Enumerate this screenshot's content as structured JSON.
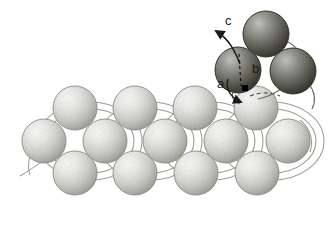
{
  "figure": {
    "background_color": "#ffffff",
    "width": 333,
    "height": 226
  },
  "colors": {
    "sphere_light_highlight": "#f2f2f0",
    "sphere_light_mid": "#cfcfca",
    "sphere_light_shadow": "#a9a9a3",
    "sphere_light_outline": "#8a8a84",
    "sphere_dark_highlight": "#b8b8b2",
    "sphere_dark_mid": "#77776f",
    "sphere_dark_shadow": "#3a3a35",
    "sphere_dark_outline": "#2b2b27",
    "bond_line": "#9b9b95",
    "annotation": "#1a1a1a",
    "marker_square": "#000000"
  },
  "labels": [
    {
      "id": "c",
      "text": "c",
      "x": 226,
      "y": 20,
      "font_size": 13
    },
    {
      "id": "b",
      "text": "b",
      "x": 254,
      "y": 68,
      "font_size": 13
    },
    {
      "id": "a",
      "text": "a",
      "x": 219,
      "y": 83,
      "font_size": 13
    }
  ],
  "annotations": {
    "arrow_c": {
      "name": "vector-arrow-c",
      "description": "curved arrow from adatom pointing up-left, labelled c",
      "path": "M 238,64 C 233,52 228,40 215,31",
      "arrow_tip": [
        207,
        29
      ]
    },
    "arrow_a": {
      "name": "vector-arrow-a",
      "description": "curved arrow from label a sweeping down-right to hollow site",
      "path": "M 228,78 C 226,88 230,97 240,101",
      "arrow_tip": [
        243,
        102
      ]
    },
    "dashed_vector_b": {
      "name": "vector-dashed-b",
      "description": "vertical dashed line through left dark sphere down to black square marker",
      "path": "M 239,56 L 241,88",
      "dash": "3 3"
    },
    "marker": {
      "name": "site-marker-square",
      "x": 245,
      "y": 88,
      "size": 5,
      "color": "#000000"
    },
    "dashed_site_arc": {
      "name": "hollow-site-dashed-arc",
      "description": "short dashed arc indicating the surface hollow site",
      "path": "M 256,97 C 264,94 274,94 282,97",
      "dash": "4 3"
    }
  },
  "lattice": {
    "name": "substrate-hexagonal-lattice",
    "sphere_radius": 22,
    "rows": [
      {
        "name": "substrate-row-top",
        "y": 108,
        "spheres": [
          {
            "id": "t1",
            "cx": 75,
            "cy": 108
          },
          {
            "id": "t2",
            "cx": 135,
            "cy": 108
          },
          {
            "id": "t3",
            "cx": 195,
            "cy": 108
          },
          {
            "id": "t4",
            "cx": 256,
            "cy": 108
          }
        ]
      },
      {
        "name": "substrate-row-middle",
        "y": 140,
        "spheres": [
          {
            "id": "m1",
            "cx": 44,
            "cy": 141
          },
          {
            "id": "m2",
            "cx": 105,
            "cy": 141
          },
          {
            "id": "m3",
            "cx": 165,
            "cy": 141
          },
          {
            "id": "m4",
            "cx": 226,
            "cy": 141
          },
          {
            "id": "m5",
            "cx": 288,
            "cy": 141
          }
        ]
      },
      {
        "name": "substrate-row-bottom",
        "y": 172,
        "spheres": [
          {
            "id": "b1",
            "cx": 75,
            "cy": 173
          },
          {
            "id": "b2",
            "cx": 135,
            "cy": 173
          },
          {
            "id": "b3",
            "cx": 196,
            "cy": 173
          },
          {
            "id": "b4",
            "cx": 257,
            "cy": 173
          }
        ]
      }
    ],
    "bond_rings": [
      {
        "cx": 90,
        "cy": 141,
        "rx": 50,
        "ry": 38
      },
      {
        "cx": 150,
        "cy": 141,
        "rx": 50,
        "ry": 38
      },
      {
        "cx": 211,
        "cy": 141,
        "rx": 50,
        "ry": 38
      },
      {
        "cx": 272,
        "cy": 141,
        "rx": 50,
        "ry": 38
      }
    ]
  },
  "adcluster": {
    "name": "adatom-trimer-cluster",
    "sphere_radius": 23,
    "spheres": [
      {
        "id": "d1",
        "cx": 266,
        "cy": 34,
        "label": "adatom-top"
      },
      {
        "id": "d2",
        "cx": 238,
        "cy": 70,
        "label": "adatom-left"
      },
      {
        "id": "d3",
        "cx": 293,
        "cy": 71,
        "label": "adatom-right"
      }
    ],
    "bonds": [
      {
        "from": "d2",
        "to": "d1",
        "path": "M 255,52 C 252,42 258,35 266,32"
      },
      {
        "from": "d1",
        "to": "d3",
        "path": "M 287,42 C 297,47 302,56 300,63"
      },
      {
        "from": "d3",
        "to": "substrate",
        "path": "M 281,88 C 272,94 264,97 257,98"
      },
      {
        "from": "d2",
        "to": "substrate",
        "path": "M 234,92 C 232,97 234,101 239,103"
      }
    ]
  }
}
